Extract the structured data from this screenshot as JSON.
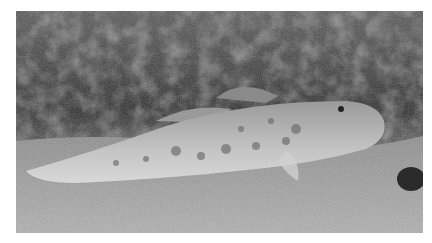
{
  "image": {
    "subject": "goby fish resting on sandy seabed",
    "background": "dark algae / seaweed",
    "tone": "grayscale",
    "colors": {
      "background_dark": "#2b2b2b",
      "algae_mid": "#6e6e6e",
      "sand": "#a8a8a8",
      "fish_body": "#b9b9b9",
      "fish_spots": "#6a6a6a",
      "border": "#ffffff"
    }
  }
}
